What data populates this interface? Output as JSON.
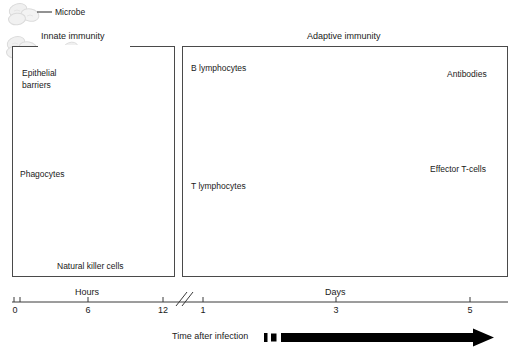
{
  "figure": {
    "title_innate": "Innate immunity",
    "title_adaptive": "Adaptive immunity"
  },
  "callouts": {
    "microbe": "Microbe"
  },
  "innate": {
    "labels": {
      "epithelial": "Epithelial\nbarriers",
      "epithelial_line1": "Epithelial",
      "epithelial_line2": "barriers",
      "phagocytes": "Phagocytes",
      "nk_cells": "Natural killer cells"
    },
    "icons": {
      "epithelial": "epithelial-cell-icon",
      "phagocyte": "phagocyte-cell-icon",
      "nk": "natural-killer-cell-icon",
      "microbe": "microbe-icon"
    }
  },
  "adaptive": {
    "rows": [
      {
        "name": "b-cell-row",
        "start_label": "B lymphocytes",
        "end_label": "Antibodies",
        "stages": [
          "naive",
          "proliferation",
          "effector"
        ]
      },
      {
        "name": "t-cell-row",
        "start_label": "T lymphocytes",
        "end_label": "Effector T-cells",
        "stages": [
          "naive",
          "proliferation",
          "effector"
        ]
      }
    ]
  },
  "timeline": {
    "segments": [
      {
        "label": "Hours",
        "ticks": [
          "0",
          "6",
          "12"
        ]
      },
      {
        "label": "Days",
        "ticks": [
          "1",
          "3",
          "5"
        ]
      }
    ],
    "hours_label": "Hours",
    "days_label": "Days",
    "tick_0": "0",
    "tick_6": "6",
    "tick_12": "12",
    "tick_1": "1",
    "tick_3": "3",
    "tick_5": "5",
    "axis_caption": "Time after infection",
    "break_marker": "//"
  },
  "colors": {
    "cell_fill": "#f2f2f2",
    "cell_stroke": "#d8d8d8",
    "phagocyte_fill": "#c9c9c9",
    "phagocyte_stroke": "#8f8f8f",
    "nucleus": "#6e6e6e",
    "panel_border": "#4a4a4a",
    "text": "#1a1a1a",
    "arrow": "#000000"
  }
}
